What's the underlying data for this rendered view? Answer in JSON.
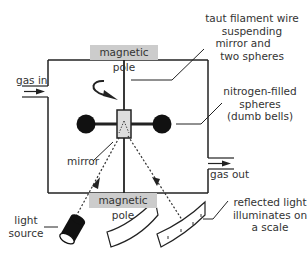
{
  "diagram": {
    "labels": {
      "pole_top": "magnetic pole",
      "pole_bottom": "magnetic pole",
      "gas_in": "gas in",
      "gas_out": "gas out",
      "filament_line1": "taut filament wire",
      "filament_line2": "suspending",
      "filament_line3": "mirror and",
      "filament_line4": "two spheres",
      "spheres_line1": "nitrogen-filled",
      "spheres_line2": "spheres",
      "spheres_line3": "(dumb bells)",
      "mirror": "mirror",
      "light_line1": "light",
      "light_line2": "source",
      "scale_line1": "reflected light",
      "scale_line2": "illuminates on",
      "scale_line3": "a scale"
    },
    "colors": {
      "line": "#222222",
      "pole_fill": "#cccccc",
      "mirror_fill": "#dddddd",
      "sphere_fill": "#111111",
      "text": "#333333"
    }
  }
}
